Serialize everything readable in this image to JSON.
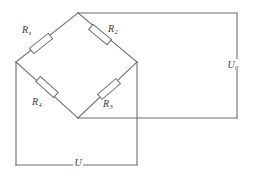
{
  "diagram": {
    "stroke_color": "#6d6d6d",
    "background_color": "#ffffff",
    "label_color": "#3a3a3a"
  },
  "components": {
    "resistors": [
      {
        "id": "rx",
        "symbol": "R",
        "subscript": "x",
        "position": "upper-left branch",
        "label_x": 22,
        "label_y": 25
      },
      {
        "id": "r2",
        "symbol": "R",
        "subscript": "2",
        "position": "upper-right branch",
        "label_x": 108,
        "label_y": 24
      },
      {
        "id": "r4",
        "symbol": "R",
        "subscript": "4",
        "position": "lower-left branch",
        "label_x": 32,
        "label_y": 97
      },
      {
        "id": "r3",
        "symbol": "R",
        "subscript": "3",
        "position": "lower-right branch",
        "label_x": 103,
        "label_y": 99
      }
    ],
    "sources": [
      {
        "id": "u0",
        "symbol": "U",
        "subscript": "0",
        "position": "right loop",
        "label_x": 228,
        "label_y": 61
      },
      {
        "id": "u",
        "symbol": "U",
        "subscript": "",
        "position": "bottom loop",
        "label_x": 75,
        "label_y": 157
      }
    ]
  },
  "nodes": {
    "top": {
      "x": 78,
      "y": 13
    },
    "left": {
      "x": 16,
      "y": 62
    },
    "right": {
      "x": 137,
      "y": 62
    },
    "bottom": {
      "x": 78,
      "y": 118
    }
  },
  "geometry": {
    "right_loop": {
      "right_edge_x": 237,
      "top_y": 13,
      "bottom_y": 118
    },
    "bottom_loop": {
      "left_edge_x": 16,
      "bottom_y": 165,
      "right_edge_x": 137,
      "top_y": 62
    }
  }
}
